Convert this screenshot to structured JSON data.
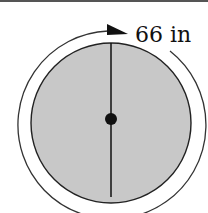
{
  "diagram": {
    "circumference_label": "66 in",
    "colors": {
      "fill": "#c8c8c8",
      "stroke": "#222222",
      "background": "#ffffff"
    },
    "elements": [
      "outer-arrow-arc",
      "circle",
      "diameter-line",
      "center-point"
    ]
  }
}
